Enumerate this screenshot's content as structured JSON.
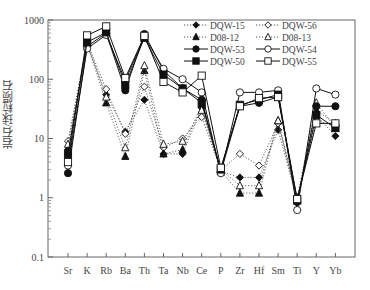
{
  "chart_data": {
    "type": "line",
    "title": "",
    "xlabel": "",
    "ylabel": "岩石/球粒陨石",
    "yscale": "log",
    "ylim": [
      0.1,
      1000
    ],
    "yticks": [
      "0.1",
      "1",
      "10",
      "100",
      "1000"
    ],
    "grid": false,
    "legend_position": "upper-right",
    "categories": [
      "Sr",
      "K",
      "Rb",
      "Ba",
      "Th",
      "Ta",
      "Nb",
      "Ce",
      "P",
      "Zr",
      "Hf",
      "Sm",
      "Ti",
      "Y",
      "Yb"
    ],
    "series": [
      {
        "name": "DQW-15",
        "marker": "diamond-filled",
        "line": "dotted",
        "values": [
          6.5,
          380,
          55,
          13,
          45,
          5.5,
          5.5,
          33,
          2.8,
          2.2,
          2.2,
          14,
          0.9,
          25,
          11
        ]
      },
      {
        "name": "DQW-56",
        "marker": "diamond-open",
        "line": "dotted",
        "values": [
          9,
          420,
          68,
          12,
          75,
          7,
          10,
          23,
          2.9,
          5.5,
          3.5,
          18,
          0.95,
          20,
          16
        ]
      },
      {
        "name": "D08-12",
        "marker": "triangle-filled",
        "line": "dotted",
        "values": [
          6,
          400,
          40,
          5,
          140,
          5.5,
          6.5,
          38,
          2.8,
          1.2,
          1.2,
          20,
          0.9,
          30,
          18
        ]
      },
      {
        "name": "D08-13",
        "marker": "triangle-open",
        "line": "dotted",
        "values": [
          8,
          410,
          50,
          7,
          170,
          8,
          9,
          30,
          3,
          1.6,
          1.6,
          20,
          1,
          40,
          15
        ]
      },
      {
        "name": "DQW-53",
        "marker": "circle-filled",
        "line": "solid",
        "values": [
          2.6,
          360,
          600,
          65,
          580,
          140,
          70,
          45,
          2.7,
          35,
          40,
          50,
          0.85,
          35,
          35
        ]
      },
      {
        "name": "DQW-54",
        "marker": "circle-open",
        "line": "solid",
        "values": [
          3.5,
          330,
          560,
          95,
          520,
          150,
          100,
          60,
          2.6,
          60,
          60,
          65,
          0.62,
          70,
          55
        ]
      },
      {
        "name": "DQW-50",
        "marker": "square-filled",
        "line": "solid",
        "values": [
          5.5,
          420,
          620,
          80,
          500,
          120,
          70,
          40,
          3,
          37,
          45,
          55,
          0.9,
          25,
          15
        ]
      },
      {
        "name": "DQW-55",
        "marker": "square-open",
        "line": "solid",
        "values": [
          4,
          550,
          780,
          105,
          540,
          90,
          60,
          115,
          3.2,
          35,
          48,
          50,
          0.95,
          18,
          18
        ]
      }
    ]
  }
}
